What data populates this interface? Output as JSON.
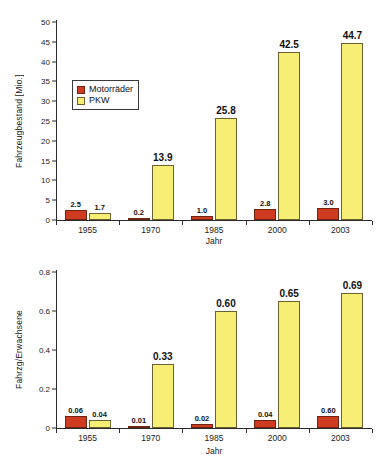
{
  "chart_data": [
    {
      "type": "bar",
      "id": "fahrzeugbestand",
      "title": "",
      "xlabel": "Jahr",
      "ylabel": "Fahrzeugbestand [Mio.]",
      "categories": [
        "1955",
        "1970",
        "1985",
        "2000",
        "2003"
      ],
      "ylim": [
        0,
        50
      ],
      "yticks": [
        "0",
        "5",
        "10",
        "15",
        "20",
        "25",
        "30",
        "35",
        "40",
        "45",
        "50"
      ],
      "ytick_values": [
        0,
        5,
        10,
        15,
        20,
        25,
        30,
        35,
        40,
        45,
        50
      ],
      "grid": false,
      "legend_position": "upper-left-inside",
      "series": [
        {
          "name": "Motorräder",
          "color": "#CE3B20",
          "values": [
            2.5,
            0.2,
            1.0,
            2.8,
            3.0
          ],
          "labels": [
            "2.5",
            "0.2",
            "1.0",
            "2.8",
            "3.0"
          ]
        },
        {
          "name": "PKW",
          "color": "#F7EE76",
          "values": [
            1.7,
            13.9,
            25.8,
            42.5,
            44.7
          ],
          "labels": [
            "1.7",
            "13.9",
            "25.8",
            "42.5",
            "44.7"
          ]
        }
      ]
    },
    {
      "type": "bar",
      "id": "fahrzeuge-pro-erwachsene",
      "title": "",
      "xlabel": "Jahr",
      "ylabel": "Fahrzg/Erwachsene",
      "categories": [
        "1955",
        "1970",
        "1985",
        "2000",
        "2003"
      ],
      "ylim": [
        0,
        0.8
      ],
      "yticks": [
        "0",
        "0.2",
        "0.4",
        "0.6",
        "0.8"
      ],
      "ytick_values": [
        0,
        0.2,
        0.4,
        0.6,
        0.8
      ],
      "grid": false,
      "legend_position": "none",
      "series": [
        {
          "name": "Motorräder",
          "color": "#CE3B20",
          "values": [
            0.06,
            0.01,
            0.02,
            0.04,
            0.06
          ],
          "labels": [
            "0.06",
            "0.01",
            "0.02",
            "0.04",
            "0.60"
          ]
        },
        {
          "name": "PKW",
          "color": "#F7EE76",
          "values": [
            0.04,
            0.33,
            0.6,
            0.65,
            0.69
          ],
          "labels": [
            "0.04",
            "0.33",
            "0.60",
            "0.65",
            "0.69"
          ]
        }
      ]
    }
  ],
  "legend": {
    "items": [
      {
        "label": "Motorräder",
        "color": "#CE3B20"
      },
      {
        "label": "PKW",
        "color": "#F7EE76"
      }
    ]
  },
  "colors": {
    "motorraeder": "#CE3B20",
    "pkw": "#F7EE76",
    "axis": "#2a2a2a",
    "background": "#ffffff"
  }
}
